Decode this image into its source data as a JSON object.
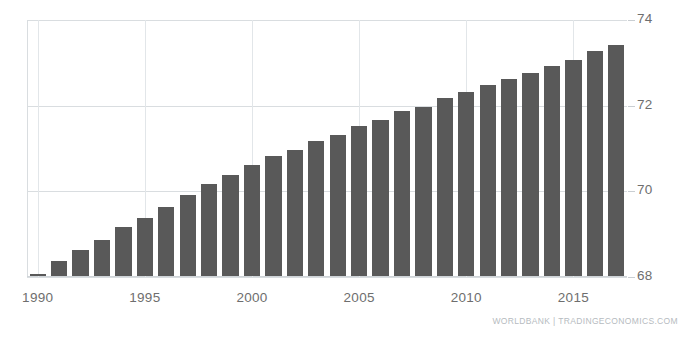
{
  "chart_data": {
    "type": "bar",
    "title": "",
    "subtitle": "",
    "xlabel": "",
    "ylabel": "",
    "ylim": [
      68,
      74
    ],
    "grid": true,
    "legend": null,
    "bar_color": "#595959",
    "gridline_color": "#d9dde0",
    "y_ticks": [
      68,
      70,
      72,
      74
    ],
    "x_ticks": [
      1990,
      1995,
      2000,
      2005,
      2010,
      2015
    ],
    "categories": [
      1990,
      1991,
      1992,
      1993,
      1994,
      1995,
      1996,
      1997,
      1998,
      1999,
      2000,
      2001,
      2002,
      2003,
      2004,
      2005,
      2006,
      2007,
      2008,
      2009,
      2010,
      2011,
      2012,
      2013,
      2014,
      2015,
      2016,
      2017
    ],
    "values": [
      68.05,
      68.35,
      68.6,
      68.85,
      69.15,
      69.35,
      69.6,
      69.9,
      70.15,
      70.35,
      70.6,
      70.8,
      70.95,
      71.15,
      71.3,
      71.5,
      71.65,
      71.85,
      71.95,
      72.15,
      72.3,
      72.45,
      72.6,
      72.75,
      72.9,
      73.05,
      73.25,
      73.4
    ]
  },
  "source": {
    "note": "WORLDBANK | TRADINGECONOMICS.COM"
  }
}
